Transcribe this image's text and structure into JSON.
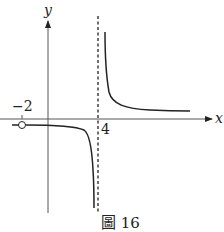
{
  "figure": {
    "caption": "圖 16",
    "axes": {
      "x_label": "x",
      "y_label": "y"
    },
    "tick_labels": {
      "neg_two": "−2",
      "four": "4"
    },
    "colors": {
      "stroke": "#222222",
      "background": "#ffffff"
    },
    "features": {
      "vertical_asymptote": "x = 4 (dashed)",
      "horizontal_asymptote": "y ≈ small constant",
      "hole": "open circle at x = -2"
    }
  }
}
